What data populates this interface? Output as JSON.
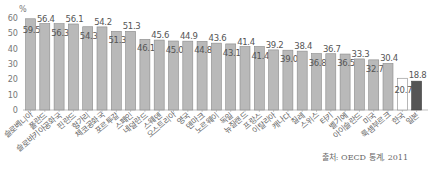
{
  "chart_data": {
    "type": "bar",
    "title": "",
    "ylabel": "%",
    "xlabel": "",
    "ylim": [
      0,
      60
    ],
    "yticks": [
      0,
      10,
      20,
      30,
      40,
      50,
      60
    ],
    "grid": false,
    "legend": null,
    "categories": [
      "슬로베니아",
      "폴란드",
      "슬로바키아공화국",
      "핀란드",
      "헝가리",
      "체코공화국",
      "포르투갈",
      "스페인",
      "네덜란드",
      "스웨덴",
      "오스트리아",
      "영국",
      "덴마크",
      "노르웨이",
      "독일",
      "뉴질랜드",
      "프랑스",
      "이탈리아",
      "캐나다",
      "칠레",
      "스위스",
      "터키",
      "벨기에",
      "아이슬란드",
      "미국",
      "룩셈부르크",
      "한국",
      "일본"
    ],
    "values": [
      59.5,
      56.4,
      56.3,
      56.1,
      54.3,
      54.2,
      51.3,
      51.3,
      46.1,
      45.6,
      45.0,
      44.9,
      44.8,
      43.6,
      43.1,
      41.4,
      41.4,
      39.2,
      39.0,
      38.4,
      36.8,
      36.7,
      36.5,
      33.3,
      32.7,
      30.4,
      20.7,
      18.8
    ],
    "value_labels": [
      "59.5",
      "56.4",
      "56.3",
      "56.1",
      "54.3",
      "54.2",
      "51.3",
      "51.3",
      "46.1",
      "45.6",
      "45.0",
      "44.9",
      "44.8",
      "43.6",
      "43.1",
      "41.4",
      "41.4",
      "39.2",
      "39.0",
      "38.4",
      "36.8",
      "36.7",
      "36.5",
      "33.3",
      "32.7",
      "30.4",
      "20.7",
      "18.8"
    ],
    "highlight": {
      "한국": "outline-white",
      "일본": "dark"
    },
    "colors": {
      "default": "#b9b9b9",
      "bar_border": "#8a8a8a",
      "korea": "#ffffff",
      "japan": "#555555"
    },
    "source": "출처: OECD 통계, 2011"
  }
}
